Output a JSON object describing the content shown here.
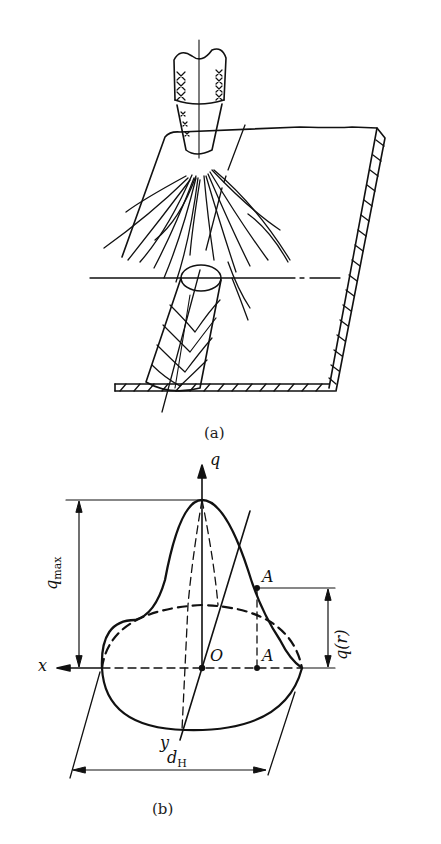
{
  "figure": {
    "part_a": {
      "caption": "(a)",
      "elements": [
        "welding-torch",
        "arc-flux-lines",
        "plate-with-hatched-section",
        "weld-bead",
        "centerline-axes"
      ]
    },
    "part_b": {
      "caption": "(b)",
      "labels": {
        "q_axis": "q",
        "q_max": "q",
        "q_max_sub": "max",
        "q_r": "q(r)",
        "point_A_top": "A",
        "point_A_bottom": "A",
        "origin": "O",
        "x_axis": "x",
        "y_axis": "y",
        "d_H": "d",
        "d_H_sub": "H"
      }
    }
  },
  "colors": {
    "stroke": "#111111",
    "background": "#ffffff"
  }
}
